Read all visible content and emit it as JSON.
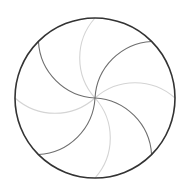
{
  "diagram": {
    "type": "pinwheel-circle",
    "background": "#ffffff",
    "center": [
      95,
      98
    ],
    "radius": 80,
    "outer_circle": {
      "stroke": "#333333",
      "stroke_width": 1.6
    },
    "arc_radius": 60,
    "arcs": [
      {
        "angle_deg": -135,
        "tone": "dark"
      },
      {
        "angle_deg": -90,
        "tone": "light"
      },
      {
        "angle_deg": -45,
        "tone": "dark"
      },
      {
        "angle_deg": 0,
        "tone": "light"
      },
      {
        "angle_deg": 45,
        "tone": "dark"
      },
      {
        "angle_deg": 90,
        "tone": "light"
      },
      {
        "angle_deg": 135,
        "tone": "dark"
      },
      {
        "angle_deg": 180,
        "tone": "light"
      }
    ],
    "tones": {
      "dark": {
        "stroke": "#6e6e6e",
        "stroke_width": 1.1
      },
      "light": {
        "stroke": "#d4d4d4",
        "stroke_width": 1.1
      }
    }
  }
}
